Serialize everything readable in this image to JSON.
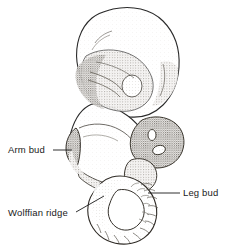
{
  "figure": {
    "kind": "anatomical-line-drawing",
    "background_color": "#ffffff",
    "ink_color": "#1a1a1a",
    "shade_colors": {
      "light_stipple": "#e8e6e2",
      "mid_stipple": "#bdbab4",
      "dark_stipple": "#8e8a84"
    }
  },
  "labels": {
    "arm_bud": {
      "text": "Arm bud",
      "leader": "horizontal line from text to limb bud on the left flank"
    },
    "wolffian_ridge": {
      "text": "Wolffian ridge",
      "leader": "diagonal line from text up-right to the flank ridge"
    },
    "leg_bud": {
      "text": "Leg bud",
      "leader": "horizontal line from text left to the posterior limb bud"
    }
  },
  "structures": [
    {
      "name": "head",
      "note": "large rounded cranial mass, upper portion"
    },
    {
      "name": "otic-vesicle",
      "note": "small circle within shaded cranial region"
    },
    {
      "name": "pharyngeal-arches",
      "note": "shaded bands below the head"
    },
    {
      "name": "arm-bud",
      "note": "anterior limb bud on left flank"
    },
    {
      "name": "wolffian-ridge",
      "note": "ridge running along the lower flank"
    },
    {
      "name": "leg-bud",
      "note": "posterior limb bud, right side"
    },
    {
      "name": "tail",
      "note": "curled caudal process with segmented somite markings"
    },
    {
      "name": "yolk-stalk-mass",
      "note": "stippled mass right of body with two small openings"
    }
  ]
}
